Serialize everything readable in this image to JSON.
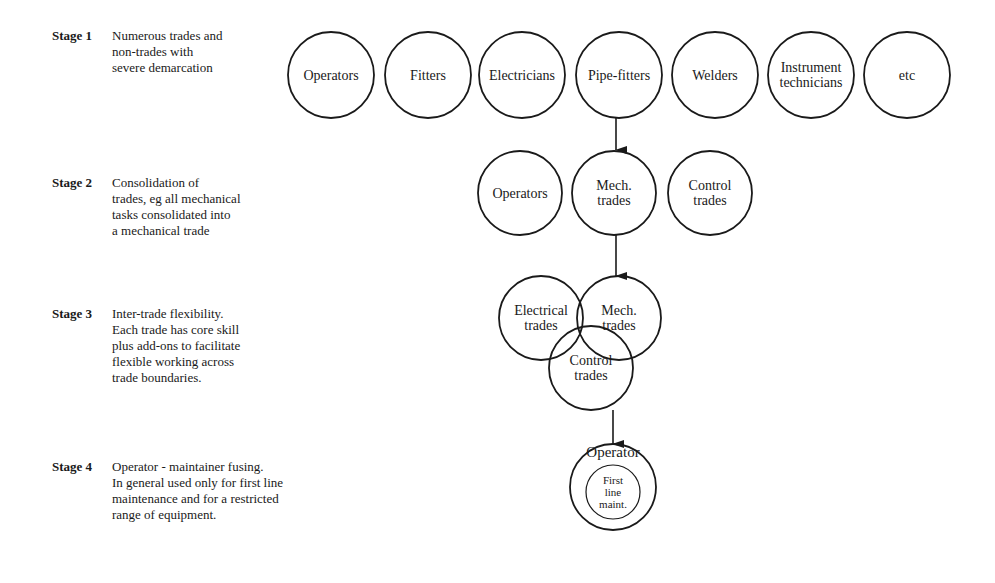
{
  "stages": [
    {
      "label": "Stage 1",
      "description": "Numerous trades and\nnon-trades with\nsevere demarcation",
      "label_pos": [
        52,
        28
      ],
      "desc_pos": [
        112,
        28
      ]
    },
    {
      "label": "Stage 2",
      "description": "Consolidation of\ntrades, eg all mechanical\ntasks consolidated into\na mechanical trade",
      "label_pos": [
        52,
        175
      ],
      "desc_pos": [
        112,
        175
      ]
    },
    {
      "label": "Stage 3",
      "description": "Inter-trade flexibility.\nEach trade has core skill\nplus add-ons to facilitate\nflexible working across\ntrade boundaries.",
      "label_pos": [
        52,
        306
      ],
      "desc_pos": [
        112,
        306
      ]
    },
    {
      "label": "Stage 4",
      "description": "Operator - maintainer fusing.\nIn general used only for first line\nmaintenance and for a restricted\nrange of equipment.",
      "label_pos": [
        52,
        459
      ],
      "desc_pos": [
        112,
        459
      ]
    }
  ],
  "circles": [
    {
      "id": "s1-operators",
      "stage": 1,
      "cx": 331,
      "cy": 75,
      "r": 43,
      "lines": [
        "Operators"
      ]
    },
    {
      "id": "s1-fitters",
      "stage": 1,
      "cx": 428,
      "cy": 75,
      "r": 43,
      "lines": [
        "Fitters"
      ]
    },
    {
      "id": "s1-electricians",
      "stage": 1,
      "cx": 522,
      "cy": 75,
      "r": 43,
      "lines": [
        "Electricians"
      ]
    },
    {
      "id": "s1-pipe-fitters",
      "stage": 1,
      "cx": 619,
      "cy": 75,
      "r": 43,
      "lines": [
        "Pipe-fitters"
      ]
    },
    {
      "id": "s1-welders",
      "stage": 1,
      "cx": 715,
      "cy": 75,
      "r": 43,
      "lines": [
        "Welders"
      ]
    },
    {
      "id": "s1-instrument-technicians",
      "stage": 1,
      "cx": 811,
      "cy": 75,
      "r": 43,
      "lines": [
        "Instrument",
        "technicians"
      ]
    },
    {
      "id": "s1-etc",
      "stage": 1,
      "cx": 907,
      "cy": 75,
      "r": 43,
      "lines": [
        "etc"
      ]
    },
    {
      "id": "s2-operators",
      "stage": 2,
      "cx": 520,
      "cy": 193,
      "r": 42,
      "lines": [
        "Operators"
      ]
    },
    {
      "id": "s2-mech-trades",
      "stage": 2,
      "cx": 614,
      "cy": 193,
      "r": 42,
      "lines": [
        "Mech.",
        "trades"
      ]
    },
    {
      "id": "s2-control-trades",
      "stage": 2,
      "cx": 710,
      "cy": 193,
      "r": 42,
      "lines": [
        "Control",
        "trades"
      ]
    },
    {
      "id": "s3-electrical-trades",
      "stage": 3,
      "cx": 541,
      "cy": 318,
      "r": 42,
      "lines": [
        "Electrical",
        "trades"
      ]
    },
    {
      "id": "s3-mech-trades",
      "stage": 3,
      "cx": 619,
      "cy": 318,
      "r": 42,
      "lines": [
        "Mech.",
        "trades"
      ]
    },
    {
      "id": "s3-control-trades",
      "stage": 3,
      "cx": 591,
      "cy": 368,
      "r": 42,
      "lines": [
        "Control",
        "trades"
      ]
    },
    {
      "id": "s4-operator",
      "stage": 4,
      "cx": 613,
      "cy": 487,
      "r": 43,
      "lines": [
        "Operator"
      ],
      "text_y": 457
    },
    {
      "id": "s4-first-line-maint",
      "stage": 4,
      "cx": 613,
      "cy": 492,
      "r": 27,
      "lines": [
        "First",
        "line",
        "maint."
      ],
      "small": true
    }
  ],
  "arrows": [
    {
      "x": 616,
      "y1": 118,
      "y2": 150
    },
    {
      "x": 616,
      "y1": 235,
      "y2": 276
    },
    {
      "x": 613,
      "y1": 410,
      "y2": 444
    }
  ],
  "colors": {
    "stroke": "#1a1a1a",
    "background": "#ffffff"
  }
}
